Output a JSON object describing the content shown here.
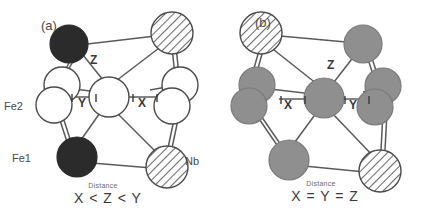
{
  "figure": {
    "panels": [
      {
        "tag": "(a)",
        "atom_labels": {
          "fe2": "Fe2",
          "fe1": "Fe1",
          "nb": "Nb"
        },
        "bond_labels": {
          "x": "X",
          "y": "Y",
          "z": "Z"
        },
        "caption_small": "Distance",
        "caption_main": "X < Z < Y"
      },
      {
        "tag": "(b)",
        "bond_labels": {
          "x": "X",
          "y": "Y",
          "z": "Z"
        },
        "caption_small": "Distance",
        "caption_main": "X = Y = Z"
      }
    ]
  },
  "colors": {
    "background": "#ffffff",
    "outline": "#4a4a4a",
    "bond": "#5a5a5a",
    "atom_black": "#2b2b2b",
    "atom_white": "#ffffff",
    "atom_gray": "#8f8f8f",
    "hatch_line": "#6a6a6a",
    "text": "#4a4a4a"
  }
}
